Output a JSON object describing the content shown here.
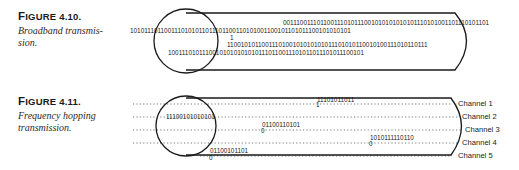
{
  "figures": [
    {
      "label_prefix": "F",
      "label_rest": "IGURE 4.10.",
      "description": "Broadband transmis-sion.",
      "description_lines": [
        "Broadband transmis-",
        "sion."
      ],
      "diagram": {
        "type": "broadband",
        "bit_rows": [
          "001110011101100111010111001010101010101110101001101110101101",
          "1010111011001110101011011101100110101001100101101011100101010101",
          "1",
          "1100101011001110100101010101011101010110010100111010110111",
          "100111010111001010101010101110110011101011011101011100101"
        ]
      }
    },
    {
      "label_prefix": "F",
      "label_rest": "IGURE 4.11.",
      "description": "Frequency hopping transmission.",
      "description_lines": [
        "Frequency hopping",
        "transmission."
      ],
      "diagram": {
        "type": "frequency-hopping",
        "channels": [
          "Channel 1",
          "Channel 2",
          "Channel 3",
          "Channel 4",
          "Channel 5"
        ],
        "hops": [
          {
            "channel": 1,
            "bits": "11101011011",
            "marker": "1"
          },
          {
            "channel": 2,
            "bits": "11100101010101",
            "marker": ""
          },
          {
            "channel": 3,
            "bits": "01100110101",
            "marker": "0"
          },
          {
            "channel": 4,
            "bits": "1010111110110",
            "marker": "0"
          },
          {
            "channel": 5,
            "bits": "01100101101",
            "marker": "0"
          }
        ]
      }
    }
  ]
}
